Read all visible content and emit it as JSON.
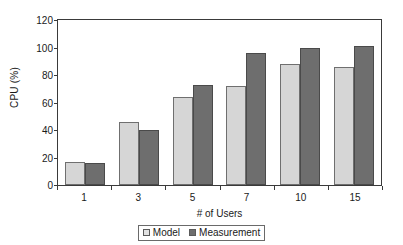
{
  "chart_data": {
    "type": "bar",
    "title": "",
    "xlabel": "# of Users",
    "ylabel": "CPU (%)",
    "categories": [
      "1",
      "3",
      "5",
      "7",
      "10",
      "15"
    ],
    "series": [
      {
        "name": "Model",
        "color": "#d6d6d6",
        "values": [
          17,
          46,
          64,
          72,
          88,
          86
        ]
      },
      {
        "name": "Measurement",
        "color": "#6e6e6e",
        "values": [
          16,
          40,
          73,
          96,
          100,
          101
        ]
      }
    ],
    "ylim": [
      0,
      120
    ],
    "yticks": [
      0,
      20,
      40,
      60,
      80,
      100,
      120
    ],
    "ytick_labels": [
      "0",
      "20",
      "40",
      "60",
      "80",
      "100",
      "120"
    ],
    "grid": false,
    "legend_position": "bottom-center"
  }
}
